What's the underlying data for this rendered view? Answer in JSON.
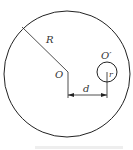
{
  "diagram": {
    "labels": {
      "big_radius": "R",
      "big_center": "O",
      "small_center": "O′",
      "small_radius": "r",
      "distance": "d"
    },
    "caption": "",
    "colors": {
      "stroke": "#222222",
      "text": "#333333"
    }
  }
}
